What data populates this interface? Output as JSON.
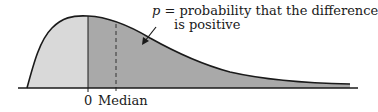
{
  "diagram": {
    "type": "probability-density-curve",
    "colors": {
      "curve": "#1a1a1a",
      "left_fill": "#d9d9d9",
      "right_fill": "#a9a9a9",
      "axis": "#1a1a1a",
      "median_line": "#333333"
    },
    "annotation": {
      "symbol": "p",
      "line1_rest": " = probability that the difference",
      "line2": "is positive"
    },
    "axis_labels": {
      "zero": "0",
      "median": "Median"
    }
  }
}
